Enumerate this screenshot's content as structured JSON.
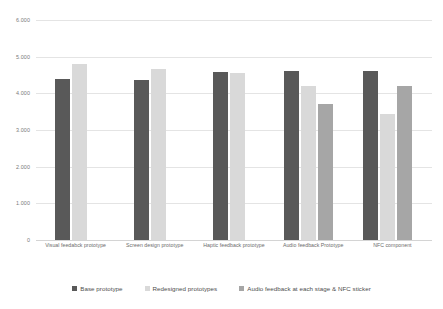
{
  "chart_data": {
    "type": "bar",
    "title": "",
    "subtitle": "",
    "xlabel": "",
    "ylabel": "",
    "categories": [
      "Visual feedabck prototype",
      "Screen design prototype",
      "Haptic feedback prototype",
      "Audio feedback Prototype",
      "NFC component"
    ],
    "series": [
      {
        "name": "Base prototype",
        "color": "#595959",
        "values": [
          4.38,
          4.37,
          4.57,
          4.6,
          4.61
        ]
      },
      {
        "name": "Redesigned prototypes",
        "color": "#d9d9d9",
        "values": [
          4.8,
          4.67,
          4.56,
          4.21,
          3.43
        ]
      },
      {
        "name": "Audio feedback at each stage & NFC sticker",
        "color": "#a6a6a6",
        "values": [
          null,
          null,
          null,
          3.71,
          4.19
        ]
      }
    ],
    "ylim": [
      0,
      6
    ],
    "ytick_values": [
      6,
      5,
      4,
      3,
      2,
      1,
      0
    ],
    "ytick_labels": [
      "6.000",
      "5.000",
      "4.000",
      "3.000",
      "2.000",
      "1.000",
      "0"
    ],
    "grid": true,
    "grid_axis": "y",
    "legend_position": "bottom",
    "background_color": "#ffffff",
    "gridline_color": "#e4e4e4"
  },
  "legend": {
    "items": [
      {
        "label": "Base prototype",
        "color": "#595959"
      },
      {
        "label": "Redesigned prototypes",
        "color": "#d9d9d9"
      },
      {
        "label": "Audio feedback at each stage & NFC sticker",
        "color": "#a6a6a6"
      }
    ]
  }
}
